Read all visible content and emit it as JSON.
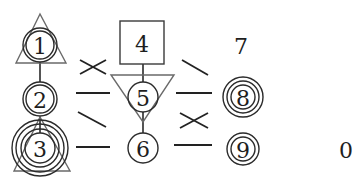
{
  "diagram": {
    "colors": {
      "stroke": "#2a2a2a",
      "triangle": "#6a6a6a",
      "background": "#ffffff"
    },
    "nodes": [
      {
        "id": "1",
        "label": "1",
        "x": 40,
        "y": 45,
        "rings": [
          17,
          14
        ],
        "shape": "triangle-up"
      },
      {
        "id": "2",
        "label": "2",
        "x": 40,
        "y": 99,
        "rings": [
          17,
          14
        ],
        "shape": "none"
      },
      {
        "id": "3",
        "label": "3",
        "x": 40,
        "y": 148,
        "rings": [
          28,
          24,
          19,
          15
        ],
        "shape": "triangle-up"
      },
      {
        "id": "4",
        "label": "4",
        "x": 142,
        "y": 44,
        "rings": [],
        "shape": "square"
      },
      {
        "id": "5",
        "label": "5",
        "x": 143,
        "y": 97,
        "rings": [
          15
        ],
        "shape": "triangle-down"
      },
      {
        "id": "6",
        "label": "6",
        "x": 143,
        "y": 148,
        "rings": [
          15
        ],
        "shape": "none"
      },
      {
        "id": "7",
        "label": "7",
        "x": 241,
        "y": 46,
        "rings": [],
        "shape": "none"
      },
      {
        "id": "8",
        "label": "8",
        "x": 243,
        "y": 97,
        "rings": [
          20,
          16,
          12
        ],
        "shape": "none"
      },
      {
        "id": "9",
        "label": "9",
        "x": 243,
        "y": 149,
        "rings": [
          16,
          12
        ],
        "shape": "none"
      }
    ],
    "isolated_label": {
      "label": "0",
      "x": 346,
      "y": 150
    },
    "vertical_links": [
      [
        "1",
        "2"
      ],
      [
        "2",
        "3"
      ],
      [
        "4",
        "5"
      ],
      [
        "5",
        "6"
      ]
    ],
    "connector_marks": [
      {
        "type": "cross",
        "x": 92,
        "y": 66
      },
      {
        "type": "dash",
        "x": 92,
        "y": 93
      },
      {
        "type": "slash-down",
        "x": 92,
        "y": 121
      },
      {
        "type": "dash",
        "x": 92,
        "y": 147
      },
      {
        "type": "slash-down",
        "x": 193,
        "y": 69
      },
      {
        "type": "dash",
        "x": 193,
        "y": 93
      },
      {
        "type": "cross",
        "x": 193,
        "y": 120
      },
      {
        "type": "dash",
        "x": 193,
        "y": 145
      }
    ]
  }
}
